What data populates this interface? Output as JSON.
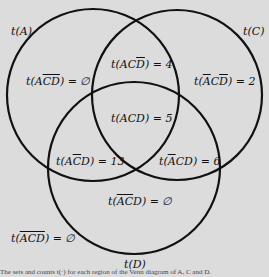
{
  "diagram": {
    "type": "venn",
    "sets": [
      {
        "id": "A",
        "label": "t(A)"
      },
      {
        "id": "C",
        "label": "t(C)"
      },
      {
        "id": "D",
        "label": "t(D)"
      }
    ],
    "regions": [
      {
        "id": "A_notC_notD",
        "set_text": "A",
        "comp": "CD",
        "value": "∅"
      },
      {
        "id": "A_C_notD",
        "set_text": "AC",
        "comp": "D",
        "value": "4"
      },
      {
        "id": "notA_C_notD",
        "comp_all": "ACD_with_A_and_D_bars",
        "value": "2"
      },
      {
        "id": "A_C_D",
        "value": "5"
      },
      {
        "id": "A_notC_D",
        "value": "13"
      },
      {
        "id": "notA_C_D",
        "value": "6"
      },
      {
        "id": "notA_notC_D",
        "value": "∅"
      },
      {
        "id": "notA_notC_notD",
        "value": "∅"
      }
    ],
    "caption": "The sets and counts t(·) for each region of the Venn diagram of A, C and D."
  },
  "labels": {
    "tA": "t(A)",
    "tC": "t(C)",
    "tD": "t(D)",
    "eq": " = "
  }
}
